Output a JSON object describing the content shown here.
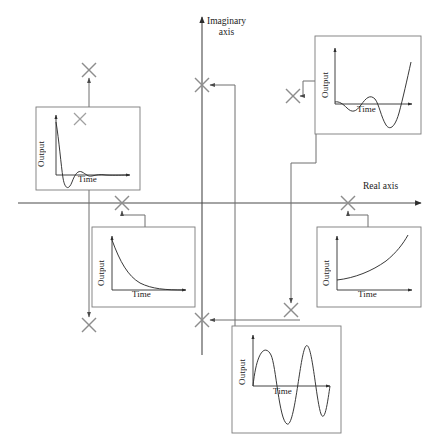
{
  "figure": {
    "type": "s-plane-pole-response-diagram",
    "top_cut_text": "",
    "axes": {
      "imaginary_label_line1": "Imaginary",
      "imaginary_label_line2": "axis",
      "real_label": "Real axis",
      "real_axis_y": 203,
      "imaginary_axis_x": 202,
      "line_color": "#3a3a3a",
      "box_color": "#6e6e6e",
      "pole_color": "#8a8a8a"
    },
    "panels": [
      {
        "id": "panel-damped-oscillation",
        "name": "damped-oscillation-response",
        "ylabel": "Output",
        "xlabel": "Time",
        "response": "underdamped decaying oscillation",
        "box": {
          "x": 36,
          "y": 107,
          "w": 104,
          "h": 83
        },
        "pole_marker_inside": {
          "x": 89,
          "y": 124
        }
      },
      {
        "id": "panel-growing-oscillation",
        "name": "growing-oscillation-response",
        "ylabel": "Output",
        "xlabel": "Time",
        "response": "unstable growing oscillation",
        "box": {
          "x": 315,
          "y": 36,
          "w": 106,
          "h": 98
        }
      },
      {
        "id": "panel-exponential-decay",
        "name": "exponential-decay-response",
        "ylabel": "Output",
        "xlabel": "Time",
        "response": "first-order exponential decay",
        "box": {
          "x": 92,
          "y": 227,
          "w": 103,
          "h": 80
        }
      },
      {
        "id": "panel-exponential-growth",
        "name": "exponential-growth-response",
        "ylabel": "Output",
        "xlabel": "Time",
        "response": "unstable exponential growth",
        "box": {
          "x": 317,
          "y": 227,
          "w": 104,
          "h": 80
        }
      },
      {
        "id": "panel-sustained-oscillation",
        "name": "sustained-oscillation-response",
        "ylabel": "Output",
        "xlabel": "Time",
        "response": "marginally stable sustained sinusoid",
        "box": {
          "x": 232,
          "y": 326,
          "w": 109,
          "h": 107
        }
      }
    ],
    "poles": [
      {
        "name": "pole-upper-left-complex",
        "x": 89,
        "y": 70,
        "quadrant": "upper-left",
        "links_to": "panel-damped-oscillation"
      },
      {
        "name": "pole-lower-left-complex",
        "x": 89,
        "y": 325,
        "quadrant": "lower-left",
        "links_to": "panel-damped-oscillation"
      },
      {
        "name": "pole-negative-real",
        "x": 122,
        "y": 203,
        "quadrant": "negative-real-axis",
        "links_to": "panel-exponential-decay"
      },
      {
        "name": "pole-upper-imaginary",
        "x": 202,
        "y": 85,
        "quadrant": "positive-imaginary-axis",
        "links_to": "panel-sustained-oscillation"
      },
      {
        "name": "pole-lower-imaginary",
        "x": 202,
        "y": 320,
        "quadrant": "negative-imaginary-axis",
        "links_to": "panel-sustained-oscillation"
      },
      {
        "name": "pole-upper-right-complex",
        "x": 293,
        "y": 96,
        "quadrant": "upper-right",
        "links_to": "panel-growing-oscillation"
      },
      {
        "name": "pole-lower-right-complex",
        "x": 291,
        "y": 310,
        "quadrant": "lower-right",
        "links_to": "panel-growing-oscillation"
      },
      {
        "name": "pole-positive-real",
        "x": 348,
        "y": 203,
        "quadrant": "positive-real-axis",
        "links_to": "panel-exponential-growth"
      }
    ]
  },
  "labels": {
    "output": "Output",
    "time": "Time"
  }
}
